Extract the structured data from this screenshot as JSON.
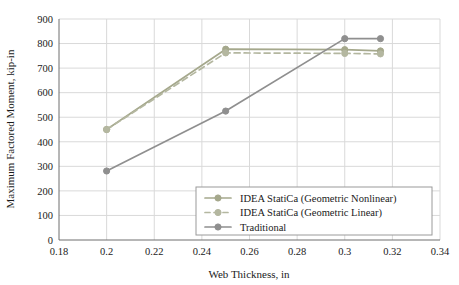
{
  "chart_data": {
    "type": "line",
    "title": "",
    "xlabel": "Web Thickness, in",
    "ylabel": "Maximum Factored Moment, kip-in",
    "xlim": [
      0.18,
      0.34
    ],
    "ylim": [
      0,
      900
    ],
    "xticks": [
      "0.18",
      "0.2",
      "0.22",
      "0.24",
      "0.26",
      "0.28",
      "0.3",
      "0.32",
      "0.34"
    ],
    "xtick_values": [
      0.18,
      0.2,
      0.22,
      0.24,
      0.26,
      0.28,
      0.3,
      0.32,
      0.34
    ],
    "yticks": [
      "0",
      "100",
      "200",
      "300",
      "400",
      "500",
      "600",
      "700",
      "800",
      "900"
    ],
    "ytick_values": [
      0,
      100,
      200,
      300,
      400,
      500,
      600,
      700,
      800,
      900
    ],
    "grid": true,
    "legend_position": "lower right",
    "series": [
      {
        "name": "IDEA StatiCa (Geometric Nonlinear)",
        "color": "#a5a88c",
        "linestyle": "solid",
        "marker": "circle",
        "x": [
          0.2,
          0.25,
          0.3,
          0.315
        ],
        "y": [
          450,
          777,
          775,
          770
        ]
      },
      {
        "name": "IDEA StatiCa (Geometric Linear)",
        "color": "#b4b7a0",
        "linestyle": "dashed",
        "marker": "circle",
        "x": [
          0.2,
          0.25,
          0.3,
          0.315
        ],
        "y": [
          450,
          762,
          760,
          758
        ]
      },
      {
        "name": "Traditional",
        "color": "#8f8f8f",
        "linestyle": "solid",
        "marker": "circle",
        "x": [
          0.2,
          0.25,
          0.3,
          0.315
        ],
        "y": [
          281,
          525,
          820,
          820
        ]
      }
    ]
  },
  "legend": {
    "entries": [
      {
        "label": "IDEA StatiCa (Geometric Nonlinear)"
      },
      {
        "label": "IDEA StatiCa (Geometric Linear)"
      },
      {
        "label": "Traditional"
      }
    ]
  },
  "colors": {
    "axis": "#6e6e6e",
    "grid": "#d9d9d9",
    "text": "#1a1a1a",
    "legend_border": "#9a9a9a",
    "series_nonlinear": "#a5a88c",
    "series_linear": "#b4b7a0",
    "series_traditional": "#8f8f8f"
  }
}
